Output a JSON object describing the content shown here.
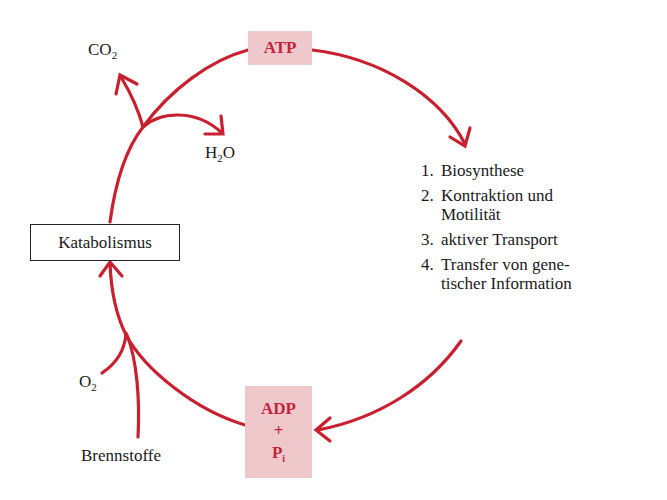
{
  "diagram": {
    "title": "",
    "nodes": {
      "atp": {
        "label": "ATP"
      },
      "adp": {
        "line1": "ADP",
        "line2": "+",
        "line3": "P",
        "line3_sub": "i"
      },
      "katabolismus": {
        "label": "Katabolismus"
      },
      "co2": {
        "main": "CO",
        "sub": "2"
      },
      "h2o": {
        "pre": "H",
        "sub": "2",
        "post": "O"
      },
      "o2": {
        "main": "O",
        "sub": "2"
      },
      "brennstoffe": {
        "label": "Brennstoffe"
      }
    },
    "uses": [
      {
        "num": "1.",
        "text": "Biosynthese"
      },
      {
        "num": "2.",
        "text": "Kontraktion und\nMotilität"
      },
      {
        "num": "3.",
        "text": "aktiver Transport"
      },
      {
        "num": "4.",
        "text": "Transfer von gene-\ntischer Information"
      }
    ],
    "colors": {
      "arrow": "#c8202f",
      "box_fill": "#efc8cb",
      "box_text": "#c4243a"
    },
    "edges": [
      {
        "from": "ATP",
        "to": "uses"
      },
      {
        "from": "uses",
        "to": "ADP + Pi"
      },
      {
        "from": "ADP + Pi",
        "to": "Katabolismus"
      },
      {
        "from": "O2",
        "to": "Katabolismus"
      },
      {
        "from": "Brennstoffe",
        "to": "Katabolismus"
      },
      {
        "from": "Katabolismus",
        "to": "ATP"
      },
      {
        "from": "Katabolismus",
        "to": "CO2"
      },
      {
        "from": "Katabolismus",
        "to": "H2O"
      }
    ]
  }
}
